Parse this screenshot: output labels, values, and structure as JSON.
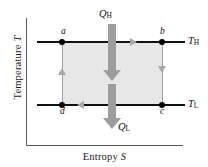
{
  "figure": {
    "axes": {
      "y_label_text": "Temperature",
      "y_label_symbol": "T",
      "x_label_text": "Entropy",
      "x_label_symbol": "S"
    },
    "state_points": [
      {
        "label": "a",
        "x": 62,
        "y": 42
      },
      {
        "label": "b",
        "x": 162,
        "y": 42
      },
      {
        "label": "c",
        "x": 162,
        "y": 105
      },
      {
        "label": "d",
        "x": 62,
        "y": 105
      }
    ],
    "reservoirs": [
      {
        "symbol": "T",
        "subscript": "H",
        "position": "upper-right"
      },
      {
        "symbol": "T",
        "subscript": "L",
        "position": "lower-right"
      }
    ],
    "heat_flows": [
      {
        "symbol": "Q",
        "subscript": "H",
        "direction": "down",
        "position": "top",
        "meaning": "heat absorbed from hot reservoir"
      },
      {
        "symbol": "Q",
        "subscript": "L",
        "direction": "down",
        "position": "bottom",
        "meaning": "heat rejected to cold reservoir"
      }
    ],
    "cycle_direction": [
      {
        "from": "a",
        "to": "b",
        "arrow": "right",
        "type": "isotherm-hot"
      },
      {
        "from": "b",
        "to": "c",
        "arrow": "down",
        "type": "adiabat"
      },
      {
        "from": "c",
        "to": "d",
        "arrow": "left",
        "type": "isotherm-cold"
      },
      {
        "from": "d",
        "to": "a",
        "arrow": "up",
        "type": "adiabat"
      }
    ],
    "colors": {
      "shaded_area": "#e7e7e7",
      "isotherm_line": "#111111",
      "adiabat_line": "#a0a0a0",
      "heat_arrow": "#9d9d9d",
      "axis": "#5a5a5a",
      "text": "#111111"
    }
  }
}
